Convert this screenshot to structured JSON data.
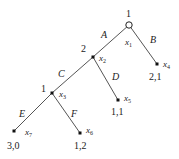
{
  "diagram": {
    "type": "extensive-form-game-tree",
    "colors": {
      "edge": "#555555",
      "node": "#111111",
      "text": "#222222"
    },
    "nodes": {
      "x1": {
        "player": "1",
        "name": "x",
        "sub": "1",
        "kind": "root-open"
      },
      "x2": {
        "player": "2",
        "name": "x",
        "sub": "2",
        "kind": "decision"
      },
      "x3": {
        "player": "1",
        "name": "x",
        "sub": "3",
        "kind": "decision"
      },
      "x4": {
        "name": "x",
        "sub": "4",
        "payoff": "2,1",
        "kind": "terminal"
      },
      "x5": {
        "name": "x",
        "sub": "5",
        "payoff": "1,1",
        "kind": "terminal"
      },
      "x6": {
        "name": "x",
        "sub": "6",
        "payoff": "1,2",
        "kind": "terminal"
      },
      "x7": {
        "name": "x",
        "sub": "7",
        "payoff": "3,0",
        "kind": "terminal"
      }
    },
    "actions": {
      "A": "A",
      "B": "B",
      "C": "C",
      "D": "D",
      "E": "E",
      "F": "F"
    }
  }
}
